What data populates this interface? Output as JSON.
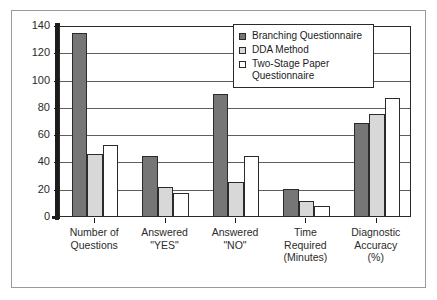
{
  "chart_data": {
    "type": "bar",
    "title": "",
    "xlabel": "",
    "ylabel": "",
    "ylim": [
      0,
      140
    ],
    "yticks": [
      0,
      20,
      40,
      60,
      80,
      100,
      120,
      140
    ],
    "grid": true,
    "legend_position": "top-right",
    "categories": [
      "Number of\nQuestions",
      "Answered\n\"YES\"",
      "Answered\n\"NO\"",
      "Time\nRequired\n(Minutes)",
      "Diagnostic\nAccuracy\n(%)"
    ],
    "category_lines": [
      [
        "Number of",
        "Questions"
      ],
      [
        "Answered",
        "\"YES\""
      ],
      [
        "Answered",
        "\"NO\""
      ],
      [
        "Time",
        "Required",
        "(Minutes)"
      ],
      [
        "Diagnostic",
        "Accuracy",
        "(%)"
      ]
    ],
    "series": [
      {
        "name": "Branching Questionnaire",
        "color": "#767676",
        "values": [
          136,
          45,
          91,
          21,
          70
        ]
      },
      {
        "name": "DDA Method",
        "color": "#d8d8d8",
        "values": [
          47,
          22,
          26,
          12,
          76
        ]
      },
      {
        "name": "Two-Stage Paper Questionnaire",
        "color": "#ffffff",
        "values": [
          53,
          18,
          45,
          8,
          88
        ]
      }
    ]
  },
  "legend": {
    "entries": [
      {
        "label": "Branching Questionnaire"
      },
      {
        "label": "DDA Method"
      },
      {
        "label": "Two-Stage Paper Questionnaire"
      }
    ]
  },
  "axis": {
    "y_tick_labels": [
      "140",
      "120",
      "100",
      "80",
      "60",
      "40",
      "20",
      "0"
    ]
  }
}
